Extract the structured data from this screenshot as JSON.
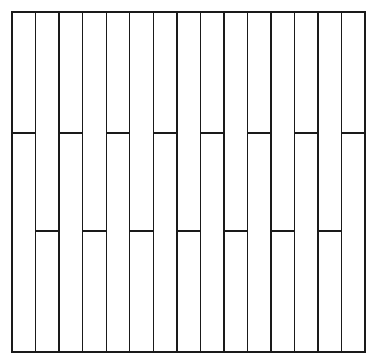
{
  "figure": {
    "canvas": {
      "width": 378,
      "height": 364,
      "background": "#ffffff"
    }
  },
  "style": {
    "line_color": "#1a1a1a",
    "fill_color": "#ffffff",
    "outer_stroke_width": 1.6,
    "inner_stroke_width": 1.4,
    "joint_stroke_width": 1.4
  },
  "panel": {
    "left": 12,
    "top": 12,
    "right": 365,
    "bottom": 352,
    "width": 353,
    "height": 340,
    "columns": 15,
    "column_width": 23.53
  },
  "grid": {
    "vertical_line_x": [
      12,
      35.5,
      59.1,
      82.6,
      106.2,
      129.7,
      153.3,
      176.8,
      200.4,
      223.9,
      247.5,
      271.0,
      294.6,
      318.1,
      341.7,
      365
    ],
    "horizontal_band_y": [
      133,
      231
    ]
  },
  "bands": [
    {
      "name": "upper-joint-row",
      "y": 133,
      "columns": [
        1,
        3,
        5,
        7,
        9,
        11,
        13,
        15
      ],
      "segment_count": 8
    },
    {
      "name": "lower-joint-row",
      "y": 231,
      "columns": [
        2,
        4,
        6,
        8,
        10,
        12,
        14
      ],
      "segment_count": 7
    }
  ],
  "chart_data": {
    "type": "diagram",
    "xlabel": "",
    "ylabel": "",
    "grid": true,
    "legend": "none",
    "columns": 15,
    "column_boundaries_x": [
      12,
      35.5,
      59.1,
      82.6,
      106.2,
      129.7,
      153.3,
      176.8,
      200.4,
      223.9,
      247.5,
      271.0,
      294.6,
      318.1,
      341.7,
      365
    ],
    "horizontal_joint_rows_y": [
      133,
      231
    ],
    "upper_row_columns": [
      1,
      3,
      5,
      7,
      9,
      11,
      13,
      15
    ],
    "lower_row_columns": [
      2,
      4,
      6,
      8,
      10,
      12,
      14
    ],
    "series": [
      {
        "name": "upper-joint-row",
        "values": [
          1,
          0,
          1,
          0,
          1,
          0,
          1,
          0,
          1,
          0,
          1,
          0,
          1,
          0,
          1
        ]
      },
      {
        "name": "lower-joint-row",
        "values": [
          0,
          1,
          0,
          1,
          0,
          1,
          0,
          1,
          0,
          1,
          0,
          1,
          0,
          1,
          0
        ]
      }
    ]
  }
}
